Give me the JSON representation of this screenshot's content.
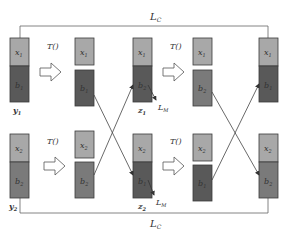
{
  "colors": {
    "x_block": "#a8a8a8",
    "b_light": "#7a7a7a",
    "b_dark": "#595959",
    "stroke": "#3a3a3a",
    "line": "#555555"
  },
  "labels": {
    "lc_top": "L",
    "lc_top_sub": "C",
    "lc_bottom": "L",
    "lc_bottom_sub": "C",
    "transform": "T()",
    "lm": "L",
    "lm_sub": "M"
  },
  "top_row": {
    "input": {
      "x": "x",
      "x_sub": "1",
      "b": "b",
      "b_sub": "1",
      "name": "y",
      "name_sub": "1"
    },
    "split": {
      "x": "x",
      "x_sub": "1",
      "b": "b",
      "b_sub": "1"
    },
    "mixed": {
      "x": "x",
      "x_sub": "1",
      "b": "b",
      "b_sub": "2",
      "name": "z",
      "name_sub": "1"
    },
    "split2": {
      "x": "x",
      "x_sub": "1",
      "b": "b",
      "b_sub": "2"
    },
    "output": {
      "x": "x",
      "x_sub": "1",
      "b": "b",
      "b_sub": "1"
    }
  },
  "bottom_row": {
    "input": {
      "x": "x",
      "x_sub": "2",
      "b": "b",
      "b_sub": "2",
      "name": "y",
      "name_sub": "2"
    },
    "split": {
      "x": "x",
      "x_sub": "2",
      "b": "b",
      "b_sub": "2"
    },
    "mixed": {
      "x": "x",
      "x_sub": "2",
      "b": "b",
      "b_sub": "1",
      "name": "z",
      "name_sub": "2"
    },
    "split2": {
      "x": "x",
      "x_sub": "2",
      "b": "b",
      "b_sub": "1"
    },
    "output": {
      "x": "x",
      "x_sub": "2",
      "b": "b",
      "b_sub": "2"
    }
  }
}
